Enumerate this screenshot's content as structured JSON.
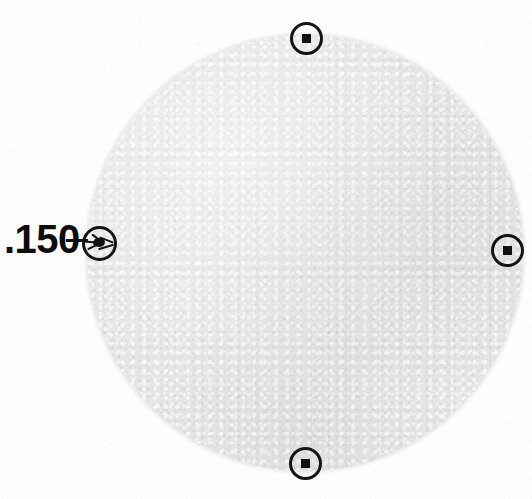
{
  "figure": {
    "kind": "scanned-specimen-figure",
    "canvas": {
      "width": 532,
      "height": 499
    },
    "background_color": "#fdfdfd",
    "ink_color": "#141414"
  },
  "disk": {
    "name": "specimen-disk",
    "center_x": 305,
    "center_y": 253,
    "radius": 218,
    "fill_color": "#e6e6e6",
    "texture": "fine-grain"
  },
  "callout": {
    "label": ".150",
    "value": 0.15,
    "font_size_px": 40,
    "label_x": 4,
    "label_y": 219,
    "leader": {
      "x": 66,
      "y": 239,
      "length": 22,
      "thickness": 3
    }
  },
  "markers": [
    {
      "name": "marker-top",
      "position": "top",
      "clock": "12",
      "center_x": 306,
      "center_y": 38,
      "diameter": 33,
      "interior": "square",
      "labeled": false
    },
    {
      "name": "marker-right",
      "position": "right",
      "clock": "3",
      "center_x": 507,
      "center_y": 250,
      "diameter": 33,
      "interior": "square",
      "labeled": false
    },
    {
      "name": "marker-bottom",
      "position": "bottom",
      "clock": "6",
      "center_x": 305,
      "center_y": 463,
      "diameter": 33,
      "interior": "square",
      "labeled": false
    },
    {
      "name": "marker-left",
      "position": "left",
      "clock": "9",
      "center_x": 99,
      "center_y": 243,
      "diameter": 35,
      "interior": "blob",
      "labeled": true,
      "label": ".150"
    }
  ]
}
